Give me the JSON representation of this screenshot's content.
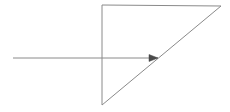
{
  "canvas": {
    "width": 230,
    "height": 112,
    "background_color": "#ffffff",
    "title": "Right triangle with incoming horizontal ray"
  },
  "style": {
    "line_color": "#8a8a8a",
    "arrow_color": "#4a4a4a",
    "line_width": 1
  },
  "chart_data": {
    "type": "diagram",
    "xlabel": "",
    "ylabel": "",
    "xlim": [
      0,
      230
    ],
    "ylim": [
      0,
      112
    ],
    "grid": false,
    "legend": "none",
    "shapes": [
      {
        "name": "right-triangle",
        "kind": "polygon",
        "closed": true,
        "points": [
          [
            102,
            5
          ],
          [
            221,
            6
          ],
          [
            102,
            105
          ]
        ],
        "vertex_labels": [
          "top-left",
          "top-right",
          "bottom-left"
        ],
        "stroke": "#8a8a8a",
        "fill": "none"
      },
      {
        "name": "incoming-ray",
        "kind": "line",
        "points": [
          [
            13,
            58
          ],
          [
            158,
            58
          ]
        ],
        "stroke": "#8a8a8a",
        "arrow_at_end": true
      }
    ],
    "arrowheads": [
      {
        "name": "ray-arrowhead",
        "tip": [
          158,
          58
        ],
        "direction": "right",
        "length": 9,
        "half_width": 3.5,
        "color": "#4a4a4a"
      }
    ],
    "annotations": [],
    "tick_labels": [],
    "legend_entries": []
  }
}
